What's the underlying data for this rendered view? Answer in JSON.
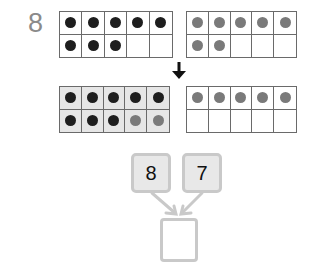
{
  "problem_number": "8",
  "top_frames": [
    {
      "name": "first-addend-frame",
      "shaded": false,
      "cells": [
        "dark",
        "dark",
        "dark",
        "dark",
        "dark",
        "dark",
        "dark",
        "dark",
        "",
        ""
      ]
    },
    {
      "name": "second-addend-frame",
      "shaded": false,
      "cells": [
        "grey",
        "grey",
        "grey",
        "grey",
        "grey",
        "grey",
        "grey",
        "",
        "",
        ""
      ]
    }
  ],
  "bottom_frames": [
    {
      "name": "make-ten-frame",
      "shaded": true,
      "cells": [
        "dark",
        "dark",
        "dark",
        "dark",
        "dark",
        "dark",
        "dark",
        "dark",
        "grey",
        "grey"
      ]
    },
    {
      "name": "remainder-frame",
      "shaded": false,
      "cells": [
        "grey",
        "grey",
        "grey",
        "grey",
        "grey",
        "",
        "",
        "",
        "",
        ""
      ]
    }
  ],
  "addends": {
    "left": "8",
    "right": "7"
  },
  "result": "",
  "colors": {
    "dark_dot": "#1e1e1e",
    "grey_dot": "#7a7a7a",
    "box_border": "#c9c9c9",
    "box_fill": "#e8e8e8"
  }
}
